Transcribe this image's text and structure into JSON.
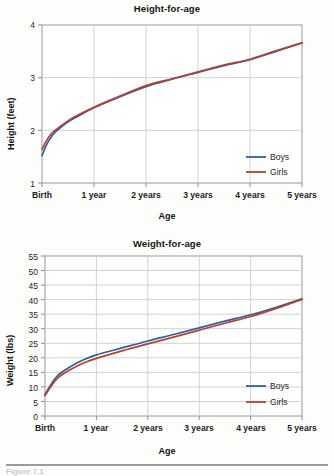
{
  "page": {
    "background": "#fdfdfc",
    "footer_caption": "Figure 7.1"
  },
  "colors": {
    "boys": "#2f5f9e",
    "girls": "#b8402e",
    "grid": "#d2d2d2",
    "axis": "#9a9a9a",
    "text": "#1a1a1a"
  },
  "chart_data": [
    {
      "id": "height-for-age",
      "type": "line",
      "title": "Height-for-age",
      "xlabel": "Age",
      "ylabel": "Height (feet)",
      "x": [
        0,
        1,
        2,
        3,
        4,
        5
      ],
      "categories": [
        "Birth",
        "1 year",
        "2 years",
        "3 years",
        "4 years",
        "5 years"
      ],
      "xlim": [
        0,
        5
      ],
      "ylim": [
        1,
        4
      ],
      "yticks": [
        1,
        2,
        3,
        4
      ],
      "ytick_labels": [
        "1",
        "2",
        "3",
        "4"
      ],
      "grid": true,
      "legend_position": "bottom-right",
      "series": [
        {
          "name": "Boys",
          "color": "#2f5f9e",
          "x": [
            0,
            0.083,
            0.167,
            0.25,
            0.5,
            0.75,
            1,
            1.5,
            2,
            2.5,
            3,
            3.5,
            4,
            4.5,
            5
          ],
          "values": [
            1.52,
            1.72,
            1.86,
            1.96,
            2.16,
            2.3,
            2.43,
            2.64,
            2.83,
            2.97,
            3.1,
            3.23,
            3.34,
            3.5,
            3.66
          ]
        },
        {
          "name": "Girls",
          "color": "#b8402e",
          "x": [
            0,
            0.083,
            0.167,
            0.25,
            0.5,
            0.75,
            1,
            1.5,
            2,
            2.5,
            3,
            3.5,
            4,
            4.5,
            5
          ],
          "values": [
            1.64,
            1.8,
            1.92,
            2.0,
            2.18,
            2.32,
            2.44,
            2.65,
            2.85,
            2.98,
            3.11,
            3.24,
            3.35,
            3.51,
            3.66
          ]
        }
      ]
    },
    {
      "id": "weight-for-age",
      "type": "line",
      "title": "Weight-for-age",
      "xlabel": "Age",
      "ylabel": "Weight (lbs)",
      "x": [
        0,
        1,
        2,
        3,
        4,
        5
      ],
      "categories": [
        "Birth",
        "1 year",
        "2 years",
        "3 years",
        "4 years",
        "5 years"
      ],
      "xlim": [
        0,
        5
      ],
      "ylim": [
        0,
        55
      ],
      "yticks": [
        0,
        5,
        10,
        15,
        20,
        25,
        30,
        35,
        40,
        45,
        50,
        55
      ],
      "ytick_labels": [
        "0",
        "5",
        "10",
        "15",
        "20",
        "25",
        "30",
        "35",
        "40",
        "45",
        "50",
        "55"
      ],
      "grid": true,
      "legend_position": "bottom-right",
      "series": [
        {
          "name": "Boys",
          "color": "#2f5f9e",
          "x": [
            0,
            0.083,
            0.25,
            0.5,
            0.75,
            1,
            1.5,
            2,
            2.5,
            3,
            3.5,
            4,
            4.5,
            5
          ],
          "values": [
            7.3,
            9.9,
            14.0,
            17.0,
            19.3,
            21.0,
            23.4,
            25.8,
            28.0,
            30.3,
            32.6,
            34.8,
            37.4,
            40.3
          ]
        },
        {
          "name": "Girls",
          "color": "#b8402e",
          "x": [
            0,
            0.083,
            0.25,
            0.5,
            0.75,
            1,
            1.5,
            2,
            2.5,
            3,
            3.5,
            4,
            4.5,
            5
          ],
          "values": [
            7.0,
            9.3,
            13.1,
            16.0,
            18.2,
            19.8,
            22.4,
            24.8,
            27.1,
            29.5,
            31.9,
            34.2,
            37.0,
            40.1
          ]
        }
      ]
    }
  ]
}
